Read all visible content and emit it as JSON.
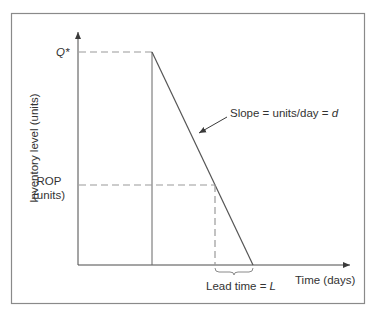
{
  "diagram": {
    "y_axis_label": "Inventory level (units)",
    "x_axis_label": "Time (days)",
    "q_star_label": "Q*",
    "rop_label_line1": "ROP",
    "rop_label_line2": "(units)",
    "slope_label_prefix": "Slope = units/day = ",
    "slope_label_var": "d",
    "lead_time_label_prefix": "Lead time = ",
    "lead_time_label_var": "L"
  },
  "colors": {
    "frame": "#8a8a8a",
    "axis": "#4a4a4a",
    "dashed": "#9a9a9a",
    "line": "#555555",
    "text": "#333333"
  }
}
